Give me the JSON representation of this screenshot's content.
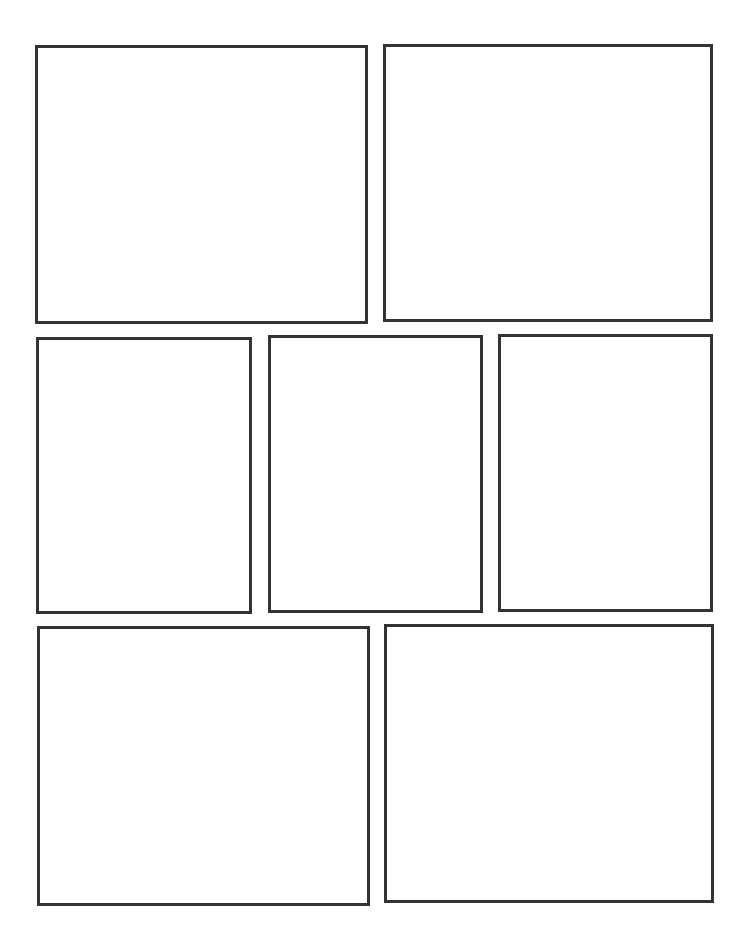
{
  "page": {
    "background": "#ffffff",
    "border_color": "#333333",
    "border_width": 3
  },
  "rows": [
    {
      "panels": [
        {
          "id": "panel-1",
          "x": 35,
          "y": 45,
          "w": 333,
          "h": 279
        },
        {
          "id": "panel-2",
          "x": 383,
          "y": 44,
          "w": 330,
          "h": 278
        }
      ]
    },
    {
      "panels": [
        {
          "id": "panel-3",
          "x": 36,
          "y": 337,
          "w": 216,
          "h": 277
        },
        {
          "id": "panel-4",
          "x": 268,
          "y": 335,
          "w": 215,
          "h": 278
        },
        {
          "id": "panel-5",
          "x": 498,
          "y": 334,
          "w": 215,
          "h": 278
        }
      ]
    },
    {
      "panels": [
        {
          "id": "panel-6",
          "x": 37,
          "y": 626,
          "w": 333,
          "h": 280
        },
        {
          "id": "panel-7",
          "x": 384,
          "y": 624,
          "w": 330,
          "h": 279
        }
      ]
    }
  ]
}
